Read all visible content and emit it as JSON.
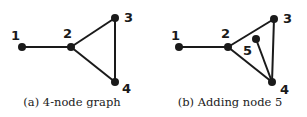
{
  "figures": [
    {
      "caption": "(a) 4-node graph",
      "nodes": [
        {
          "id": "1",
          "label": "1",
          "x": 22,
          "y": 47,
          "lx": 11,
          "ly": 40
        },
        {
          "id": "2",
          "label": "2",
          "x": 71,
          "y": 47,
          "lx": 63,
          "ly": 38
        },
        {
          "id": "3",
          "label": "3",
          "x": 115,
          "y": 18,
          "lx": 124,
          "ly": 22
        },
        {
          "id": "4",
          "label": "4",
          "x": 115,
          "y": 82,
          "lx": 122,
          "ly": 93
        }
      ],
      "edges": [
        [
          "1",
          "2"
        ],
        [
          "2",
          "3"
        ],
        [
          "2",
          "4"
        ],
        [
          "3",
          "4"
        ]
      ]
    },
    {
      "caption": "(b) Adding node 5",
      "nodes": [
        {
          "id": "1",
          "label": "1",
          "x": 179,
          "y": 47,
          "lx": 171,
          "ly": 40
        },
        {
          "id": "2",
          "label": "2",
          "x": 228,
          "y": 47,
          "lx": 221,
          "ly": 38
        },
        {
          "id": "3",
          "label": "3",
          "x": 274,
          "y": 19,
          "lx": 283,
          "ly": 23
        },
        {
          "id": "4",
          "label": "4",
          "x": 272,
          "y": 82,
          "lx": 280,
          "ly": 94
        },
        {
          "id": "5",
          "label": "5",
          "x": 256,
          "y": 39,
          "lx": 243,
          "ly": 55
        }
      ],
      "edges": [
        [
          "1",
          "2"
        ],
        [
          "2",
          "3"
        ],
        [
          "2",
          "4"
        ],
        [
          "3",
          "4"
        ],
        [
          "5",
          "4"
        ]
      ]
    }
  ],
  "colors": {
    "node": "#1a1a1a",
    "edge": "#1a1a1a"
  }
}
